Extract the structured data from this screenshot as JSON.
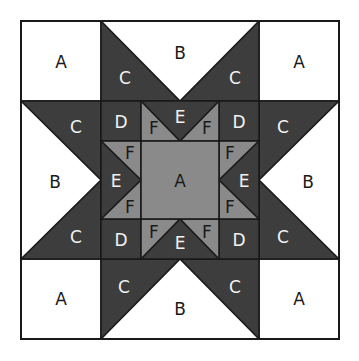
{
  "diagram": {
    "type": "quilt-block",
    "colors": {
      "white": "#ffffff",
      "dark": "#3d3d3d",
      "medium": "#8a8a8a",
      "outline": "#1a1a1a"
    },
    "labels": {
      "corner_tl": "A",
      "corner_tr": "A",
      "corner_bl": "A",
      "corner_br": "A",
      "top_b": "B",
      "top_c_left": "C",
      "top_c_right": "C",
      "bottom_b": "B",
      "bottom_c_left": "C",
      "bottom_c_right": "C",
      "left_b": "B",
      "left_c_top": "C",
      "left_c_bottom": "C",
      "right_b": "B",
      "right_c_top": "C",
      "right_c_bottom": "C",
      "inner_d_tl": "D",
      "inner_d_tr": "D",
      "inner_d_bl": "D",
      "inner_d_br": "D",
      "inner_e_top": "E",
      "inner_e_bottom": "E",
      "inner_e_left": "E",
      "inner_e_right": "E",
      "inner_f_top_left": "F",
      "inner_f_top_right": "F",
      "inner_f_bottom_left": "F",
      "inner_f_bottom_right": "F",
      "inner_f_left_top": "F",
      "inner_f_left_bottom": "F",
      "inner_f_right_top": "F",
      "inner_f_right_bottom": "F",
      "center": "A"
    }
  }
}
